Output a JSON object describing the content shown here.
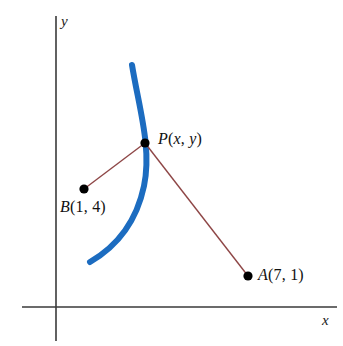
{
  "figure": {
    "background_color": "#ffffff"
  },
  "axes": {
    "x_label": "x",
    "y_label": "y",
    "axis_color": "#3a3a3a",
    "origin": {
      "x": 56,
      "y": 307
    },
    "x_axis": {
      "x1": 22,
      "y1": 307,
      "x2": 337,
      "y2": 307
    },
    "y_axis": {
      "x1": 56,
      "y1": 16,
      "x2": 56,
      "y2": 341
    },
    "x_label_position": {
      "x": 322,
      "y": 313
    },
    "y_label_position": {
      "x": 61,
      "y": 14
    }
  },
  "curve": {
    "name": "locus-curve",
    "color": "#1c6cc0",
    "stroke_width": 6,
    "path": "M 132 65 C 139 108 152 148 144 186 C 136 224 114 248 90 262",
    "description": "thick blue arc passing through point P"
  },
  "segments": [
    {
      "name": "segment-p-to-b",
      "color": "#8e4646",
      "stroke_width": 1.4,
      "from": {
        "x": 145,
        "y": 143
      },
      "to": {
        "x": 84,
        "y": 189
      }
    },
    {
      "name": "segment-p-to-a",
      "color": "#8e4646",
      "stroke_width": 1.4,
      "from": {
        "x": 145,
        "y": 143
      },
      "to": {
        "x": 248,
        "y": 276
      }
    }
  ],
  "points": [
    {
      "id": "P",
      "name": "point-p",
      "label_prefix": "P",
      "label_open": "(",
      "label_arg1": "x",
      "label_comma": ", ",
      "label_arg2": "y",
      "label_close": ")",
      "label_text": "P(x, y)",
      "arg_style": "italic",
      "x": 145,
      "y": 143,
      "radius": 4.6,
      "color": "#000000",
      "label_position": {
        "x": 158,
        "y": 131
      }
    },
    {
      "id": "B",
      "name": "point-b",
      "label_prefix": "B",
      "label_open": "(",
      "label_arg1": "1",
      "label_comma": ", ",
      "label_arg2": "4",
      "label_close": ")",
      "label_text": "B(1, 4)",
      "arg_style": "normal",
      "x": 84,
      "y": 189,
      "radius": 4.6,
      "color": "#000000",
      "label_position": {
        "x": 60,
        "y": 199
      }
    },
    {
      "id": "A",
      "name": "point-a",
      "label_prefix": "A",
      "label_open": "(",
      "label_arg1": "7",
      "label_comma": ", ",
      "label_arg2": "1",
      "label_close": ")",
      "label_text": "A(7, 1)",
      "arg_style": "normal",
      "x": 248,
      "y": 276,
      "radius": 4.6,
      "color": "#000000",
      "label_position": {
        "x": 258,
        "y": 267
      }
    }
  ],
  "chart_data": {
    "type": "scatter",
    "title": "",
    "xlabel": "x",
    "ylabel": "y",
    "grid": false,
    "legend": "none",
    "annotations": [
      "P(x, y)",
      "B(1, 4)",
      "A(7, 1)"
    ],
    "points": [
      {
        "label": "A(7, 1)",
        "x": 7,
        "y": 1
      },
      {
        "label": "B(1, 4)",
        "x": 1,
        "y": 4
      },
      {
        "label": "P(x, y)",
        "x": null,
        "y": null
      }
    ],
    "series": [
      {
        "name": "locus curve",
        "type": "curve",
        "color": "#1c6cc0",
        "description": "blue arc through P, concave toward the left"
      },
      {
        "name": "segment PB",
        "type": "line",
        "color": "#8e4646"
      },
      {
        "name": "segment PA",
        "type": "line",
        "color": "#8e4646"
      }
    ]
  }
}
